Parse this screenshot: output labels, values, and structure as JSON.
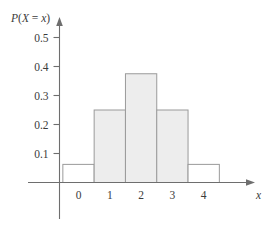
{
  "chart_data": {
    "type": "bar",
    "title": "",
    "subtitle": "",
    "xlabel": "x",
    "ylabel": "P(X = x)",
    "ylabel_parts": {
      "p": "P",
      "open_paren": "(",
      "big_x": "X",
      "equals": " = ",
      "small_x": "x",
      "close_paren": ")"
    },
    "categories": [
      "0",
      "1",
      "2",
      "3",
      "4"
    ],
    "x": [
      0,
      1,
      2,
      3,
      4
    ],
    "values": [
      0.0625,
      0.25,
      0.375,
      0.25,
      0.0625
    ],
    "bar_fills": [
      "none",
      "shaded",
      "shaded",
      "shaded",
      "none"
    ],
    "bar_width": 1,
    "xlim": [
      -0.95,
      5.05
    ],
    "ylim": [
      0,
      0.54
    ],
    "xticks": [
      "0",
      "1",
      "2",
      "3",
      "4"
    ],
    "yticks": [
      "0.1",
      "0.2",
      "0.3",
      "0.4",
      "0.5"
    ],
    "ytick_values": [
      0.1,
      0.2,
      0.3,
      0.4,
      0.5
    ],
    "grid": false,
    "legend": "none",
    "axis_arrows": [
      "x-right",
      "y-up"
    ],
    "colors": {
      "axis": "#6e6e6e",
      "bar_outline": "#9a9a9a",
      "bar_fill_shaded": "#ededed",
      "bar_fill_open": "#ffffff",
      "text": "#3b3b3b"
    }
  },
  "figure": {
    "caption": "",
    "x_axis_label": "x",
    "y_axis_label": "P(X = x)"
  }
}
